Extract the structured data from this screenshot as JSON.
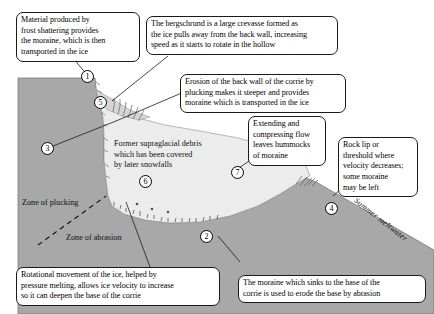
{
  "diagram": {
    "colors": {
      "rock": "#a8a8a8",
      "ice": "#e9e9e9",
      "snow_upper": "#d8d8d8",
      "background": "#ffffff",
      "outline": "#4a4a4a",
      "text": "#000000"
    }
  },
  "callouts": [
    {
      "id": "callout-1",
      "text": "Material produced by\nfrost shattering provides\nthe moraine, which is then\ntransported in the ice"
    },
    {
      "id": "callout-bergschrund",
      "text": "The bergschrund is a large crevasse formed as\nthe ice pulls away from the back wall, increasing\nspeed as it starts to rotate in the hollow"
    },
    {
      "id": "callout-plucking-backwall",
      "text": "Erosion of the back wall of the corrie by\nplucking makes it steeper and provides\nmoraine which is transported in the ice"
    },
    {
      "id": "callout-hummocks",
      "text": "Extending and\ncompressing flow\nleaves hummocks\nof moraine"
    },
    {
      "id": "callout-rock-lip",
      "text": "Rock lip or\nthreshold where\nvelocity decreases;\nsome moraine\nmay be left"
    },
    {
      "id": "callout-rotational",
      "text": "Rotational movement of the ice, helped by\npressure melting, allows ice velocity to increase\nso it can deepen the base of the corrie"
    },
    {
      "id": "callout-abrasion-base",
      "text": "The moraine which sinks to the base of the\ncorrie is used to erode the base by abrasion"
    }
  ],
  "map_labels": [
    {
      "id": "label-supraglacial",
      "text": "Former supraglacial debris\nwhich has been covered\nby later snowfalls"
    },
    {
      "id": "label-zone-plucking",
      "text": "Zone of plucking"
    },
    {
      "id": "label-zone-abrasion",
      "text": "Zone of abrasion"
    },
    {
      "id": "label-summer-meltwater",
      "text": "Summer meltwater"
    }
  ],
  "markers": [
    {
      "id": "marker-1",
      "label": "1"
    },
    {
      "id": "marker-2",
      "label": "2"
    },
    {
      "id": "marker-3",
      "label": "3"
    },
    {
      "id": "marker-4",
      "label": "4"
    },
    {
      "id": "marker-5",
      "label": "5"
    },
    {
      "id": "marker-6",
      "label": "6"
    },
    {
      "id": "marker-7",
      "label": "7"
    }
  ]
}
